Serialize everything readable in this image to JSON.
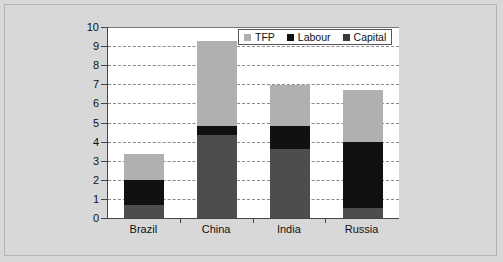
{
  "chart_data": {
    "type": "bar",
    "stacked": true,
    "title": "",
    "subtitle": "",
    "xlabel": "",
    "ylabel": "",
    "categories": [
      "Brazil",
      "China",
      "India",
      "Russia"
    ],
    "series": [
      {
        "name": "Capital",
        "color": "#4d4d4d",
        "values": [
          0.7,
          4.35,
          3.6,
          0.5
        ]
      },
      {
        "name": "Labour",
        "color": "#111111",
        "values": [
          1.3,
          0.45,
          1.2,
          3.5
        ]
      },
      {
        "name": "TFP",
        "color": "#b0b0b0",
        "values": [
          1.35,
          4.45,
          2.15,
          2.7
        ]
      }
    ],
    "stack_order_bottom_to_top": [
      "Capital",
      "Labour",
      "TFP"
    ],
    "totals": [
      3.35,
      9.25,
      6.95,
      6.7
    ],
    "ylim": [
      0,
      10
    ],
    "ytick_labels": [
      "0",
      "1",
      "2",
      "3",
      "4",
      "5",
      "6",
      "7",
      "8",
      "9",
      "10"
    ],
    "ytick_values": [
      0,
      1,
      2,
      3,
      4,
      5,
      6,
      7,
      8,
      9,
      10
    ],
    "grid": "horizontal-dashed",
    "legend_position": "top-right-inside",
    "legend_entries": [
      {
        "label": "TFP",
        "color": "#b0b0b0"
      },
      {
        "label": "Labour",
        "color": "#111111"
      },
      {
        "label": "Capital",
        "color": "#3a3a3a"
      }
    ],
    "plot_background": "#ffffff",
    "figure_background": "#d8d8d8"
  }
}
